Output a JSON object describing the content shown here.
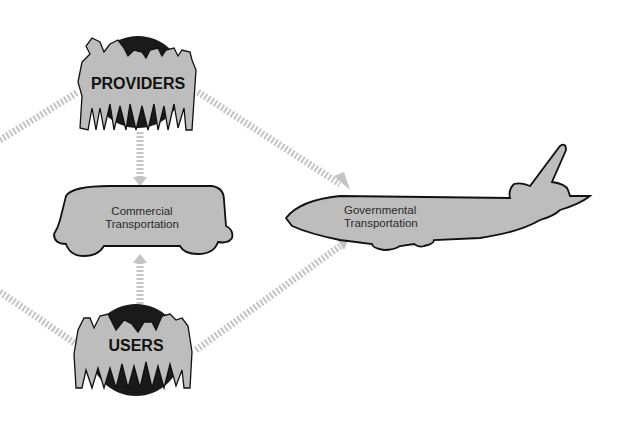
{
  "diagram": {
    "nodes": {
      "providers": {
        "label": "PROVIDERS",
        "icon": "people-group-icon"
      },
      "users": {
        "label": "USERS",
        "icon": "people-group-icon"
      },
      "commercial": {
        "line1": "Commercial",
        "line2": "Transportation",
        "icon": "bus-icon"
      },
      "governmental": {
        "line1": "Governmental",
        "line2": "Transportation",
        "icon": "airplane-icon"
      }
    },
    "edges": [
      {
        "from": "providers",
        "to": "commercial",
        "style": "hatched-arrow"
      },
      {
        "from": "users",
        "to": "commercial",
        "style": "hatched-arrow"
      },
      {
        "from": "providers",
        "to": "governmental",
        "style": "hatched-arrow"
      },
      {
        "from": "users",
        "to": "governmental",
        "style": "hatched-arrow"
      },
      {
        "from": "providers",
        "to": "offscreen-left",
        "style": "hatched-line"
      },
      {
        "from": "users",
        "to": "offscreen-left",
        "style": "hatched-line"
      }
    ],
    "colors": {
      "fill": "#bdbdbd",
      "outline": "#111111",
      "arrow": "#c4c4c4",
      "globe": "#1a1a1a"
    }
  }
}
